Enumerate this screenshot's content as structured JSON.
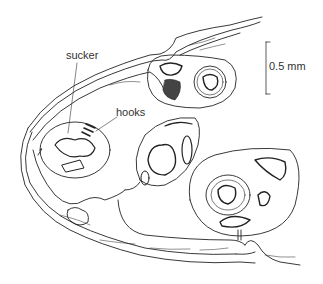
{
  "figure": {
    "labels": {
      "sucker": "sucker",
      "hooks": "hooks"
    },
    "scale_bar": {
      "label": "0.5 mm"
    },
    "colors": {
      "line": "#222222",
      "background": "#ffffff",
      "text": "#333333"
    }
  }
}
